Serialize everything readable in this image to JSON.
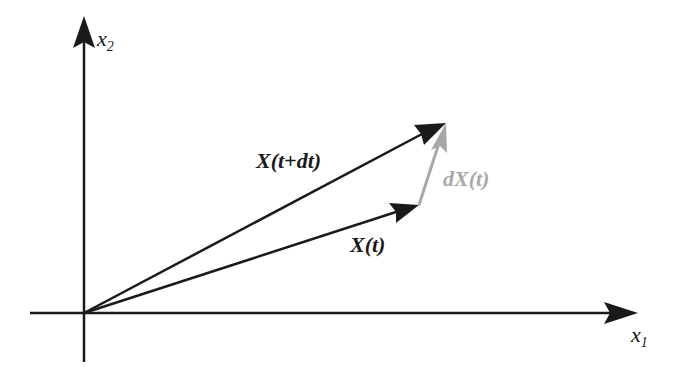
{
  "axes": {
    "x_label": "x",
    "x_sub": "1",
    "y_label": "x",
    "y_sub": "2"
  },
  "vectors": {
    "v1_label": "X(t+dt)",
    "v2_label": "X(t)",
    "diff_label": "dX(t)"
  },
  "colors": {
    "axis": "#1a1a1a",
    "vector": "#1a1a1a",
    "diff": "#a8a8a8"
  }
}
